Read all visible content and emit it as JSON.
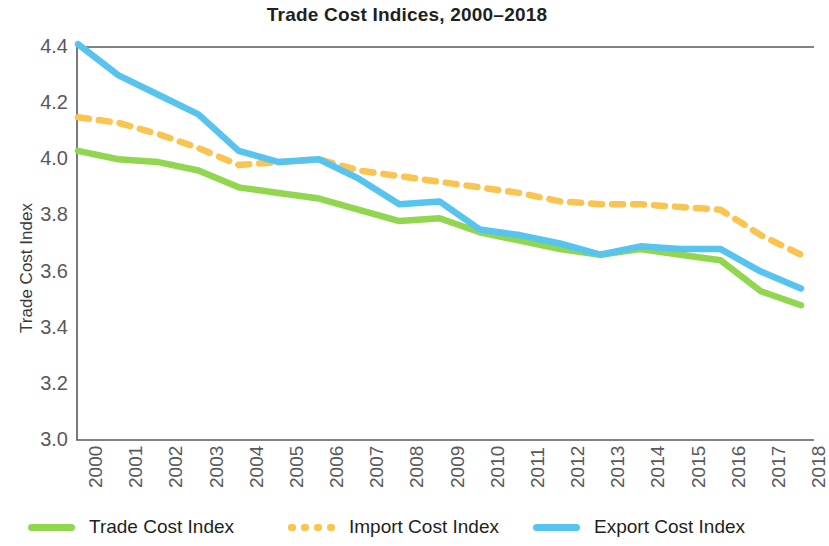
{
  "chart_data": {
    "type": "line",
    "title": "Trade Cost Indices, 2000–2018",
    "xlabel": "",
    "ylabel": "Trade Cost Index",
    "ylim": [
      3.0,
      4.4
    ],
    "yticks": [
      "3.0",
      "3.2",
      "3.4",
      "3.6",
      "3.8",
      "4.0",
      "4.2",
      "4.4"
    ],
    "grid": false,
    "legend_position": "bottom",
    "categories": [
      "2000",
      "2001",
      "2002",
      "2003",
      "2004",
      "2005",
      "2006",
      "2007",
      "2008",
      "2009",
      "2010",
      "2011",
      "2012",
      "2013",
      "2014",
      "2015",
      "2016",
      "2017",
      "2018"
    ],
    "series": [
      {
        "name": "Trade Cost Index",
        "color": "#92D64F",
        "style": "solid",
        "values": [
          4.03,
          4.0,
          3.99,
          3.96,
          3.9,
          3.88,
          3.86,
          3.82,
          3.78,
          3.79,
          3.74,
          3.71,
          3.68,
          3.66,
          3.68,
          3.66,
          3.64,
          3.53,
          3.48
        ]
      },
      {
        "name": "Import Cost Index",
        "color": "#FAC451",
        "style": "dashed",
        "values": [
          4.15,
          4.13,
          4.09,
          4.04,
          3.98,
          3.99,
          4.0,
          3.96,
          3.94,
          3.92,
          3.9,
          3.88,
          3.85,
          3.84,
          3.84,
          3.83,
          3.82,
          3.73,
          3.66
        ]
      },
      {
        "name": "Export Cost Index",
        "color": "#57C4EF",
        "style": "solid",
        "values": [
          4.41,
          4.3,
          4.23,
          4.16,
          4.03,
          3.99,
          4.0,
          3.93,
          3.84,
          3.85,
          3.75,
          3.73,
          3.7,
          3.66,
          3.69,
          3.68,
          3.68,
          3.6,
          3.54
        ]
      }
    ]
  },
  "legend": {
    "items": [
      {
        "label": "Trade Cost Index",
        "color": "#92D64F",
        "style": "solid"
      },
      {
        "label": "Import Cost Index",
        "color": "#FAC451",
        "style": "dashed"
      },
      {
        "label": "Export Cost Index",
        "color": "#57C4EF",
        "style": "solid"
      }
    ]
  },
  "axis": {
    "frame_color": "#58595b"
  }
}
